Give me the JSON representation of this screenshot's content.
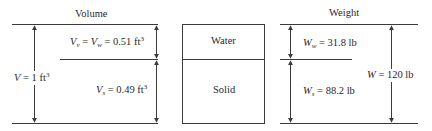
{
  "volume": {
    "title": "Volume",
    "total": {
      "symbol": "V",
      "eq": " = 1 ft",
      "exp": "3"
    },
    "voids": {
      "sym1": "V",
      "sub1": "v",
      "mid": " = ",
      "sym2": "V",
      "sub2": "w",
      "eq": " = 0.51 ft",
      "exp": "3"
    },
    "solids": {
      "symbol": "V",
      "sub": "s",
      "eq": " = 0.49 ft",
      "exp": "3"
    }
  },
  "phase_box": {
    "top": "Water",
    "bottom": "Solid"
  },
  "weight": {
    "title": "Weight",
    "water": {
      "symbol": "W",
      "sub": "w",
      "eq": " = 31.8 lb"
    },
    "solid": {
      "symbol": "W",
      "sub": "s",
      "eq": " = 88.2 lb"
    },
    "total": {
      "symbol": "W",
      "eq": " = 120 lb"
    }
  },
  "colors": {
    "line": "#3a3a3a",
    "text": "#2a2a2a",
    "background": "#ffffff"
  }
}
